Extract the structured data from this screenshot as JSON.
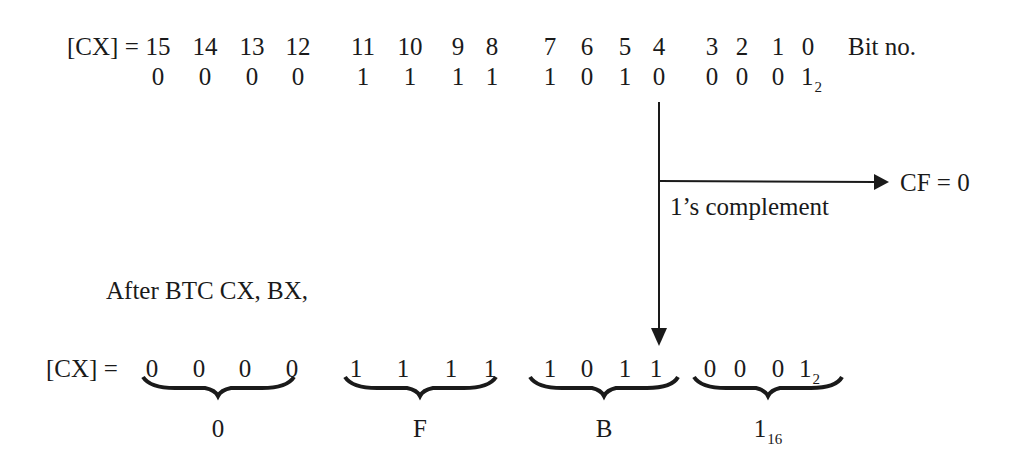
{
  "top": {
    "label": "[CX] =",
    "bit_numbers": [
      "15",
      "14",
      "13",
      "12",
      "11",
      "10",
      "9",
      "8",
      "7",
      "6",
      "5",
      "4",
      "3",
      "2",
      "1",
      "0"
    ],
    "bit_caption": "Bit no.",
    "bits_before": [
      "0",
      "0",
      "0",
      "0",
      "1",
      "1",
      "1",
      "1",
      "1",
      "0",
      "1",
      "0",
      "0",
      "0",
      "0",
      "1"
    ],
    "base_subscript": "2"
  },
  "annotation": {
    "complement_label": "1’s complement",
    "carry_flag": "CF = 0",
    "targeted_bit": "4"
  },
  "after": {
    "caption": "After BTC CX, BX,",
    "label": "[CX] =",
    "bits_after": [
      "0",
      "0",
      "0",
      "0",
      "1",
      "1",
      "1",
      "1",
      "1",
      "0",
      "1",
      "1",
      "0",
      "0",
      "0",
      "1"
    ],
    "base_subscript": "2",
    "hex_digits": [
      "0",
      "F",
      "B",
      "1"
    ],
    "hex_subscript": "16"
  },
  "colors": {
    "ink": "#1a1a1a",
    "background": "#ffffff"
  }
}
